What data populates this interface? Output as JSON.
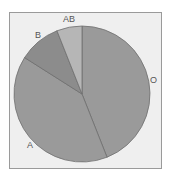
{
  "chart_data": {
    "type": "pie",
    "title": "",
    "categories": [
      "O",
      "A",
      "B",
      "AB"
    ],
    "values": [
      44,
      40,
      10,
      6
    ],
    "unit": "%",
    "start_angle_deg": 0,
    "direction": "clockwise",
    "colors": [
      "#9a9a9a",
      "#9a9a9a",
      "#8c8c8c",
      "#b6b6b6"
    ],
    "legend": "none (direct labels)",
    "labels": [
      {
        "text": "O",
        "x": 150,
        "y": 83
      },
      {
        "text": "A",
        "x": 27,
        "y": 148
      },
      {
        "text": "B",
        "x": 35,
        "y": 38
      },
      {
        "text": "AB",
        "x": 63,
        "y": 22
      }
    ]
  },
  "style": {
    "background": "#efefef",
    "border": "#9a9a9a",
    "slice_stroke": "#6f6f6f"
  }
}
